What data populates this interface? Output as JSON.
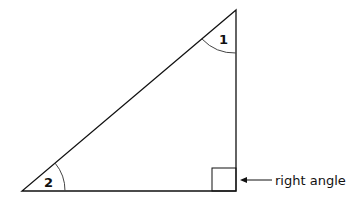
{
  "diagram": {
    "type": "right-triangle",
    "angles": [
      {
        "id": "angle-1",
        "label": "1",
        "position": "top"
      },
      {
        "id": "angle-2",
        "label": "2",
        "position": "bottom-left"
      }
    ],
    "right_angle_label": "right angle",
    "stroke_color": "#111111"
  }
}
